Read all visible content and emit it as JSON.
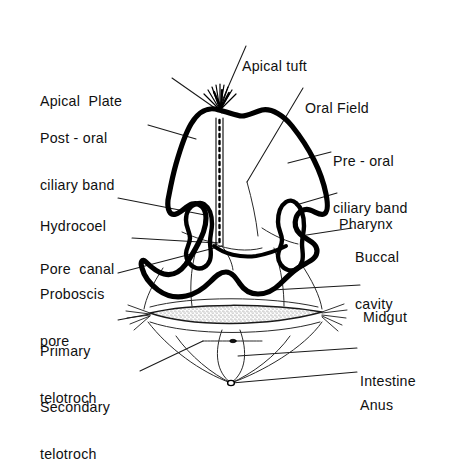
{
  "figure": {
    "type": "anatomical-diagram",
    "view": "ventral schematic",
    "background_color": "#ffffff",
    "ink_color": "#000000",
    "stipple_color": "#d8d8d8"
  },
  "labels": [
    {
      "id": "apical-tuft",
      "text": "Apical tuft",
      "lines": [
        "Apical tuft"
      ],
      "align": "left",
      "x": 242,
      "y": 28
    },
    {
      "id": "apical-plate",
      "text": "Apical  Plate",
      "lines": [
        "Apical  Plate"
      ],
      "align": "left",
      "x": 40,
      "y": 63
    },
    {
      "id": "oral-field",
      "text": "Oral Field",
      "lines": [
        "Oral Field"
      ],
      "align": "left",
      "x": 305,
      "y": 70
    },
    {
      "id": "post-oral-ciliary-band",
      "text": "Post - oral ciliary band",
      "lines": [
        "Post - oral",
        "ciliary band"
      ],
      "align": "left",
      "x": 40,
      "y": 100
    },
    {
      "id": "pre-oral-ciliary-band",
      "text": "Pre - oral ciliary band",
      "lines": [
        "Pre - oral",
        "ciliary band"
      ],
      "align": "left",
      "x": 333,
      "y": 123
    },
    {
      "id": "hydrocoel",
      "text": "Hydrocoel",
      "lines": [
        "Hydrocoel"
      ],
      "align": "left",
      "x": 40,
      "y": 188
    },
    {
      "id": "pharynx",
      "text": "Pharynx",
      "lines": [
        "Pharynx"
      ],
      "align": "left",
      "x": 339,
      "y": 186
    },
    {
      "id": "buccal-cavity",
      "text": "Buccal cavity",
      "lines": [
        "Buccal",
        "cavity"
      ],
      "align": "left",
      "x": 355,
      "y": 219
    },
    {
      "id": "pore-canal",
      "text": "Pore  canal",
      "lines": [
        "Pore  canal"
      ],
      "align": "left",
      "x": 40,
      "y": 231
    },
    {
      "id": "proboscis-pore",
      "text": "Proboscis pore",
      "lines": [
        "Proboscis",
        "pore"
      ],
      "align": "left",
      "x": 40,
      "y": 256
    },
    {
      "id": "midgut",
      "text": "Midgut",
      "lines": [
        "Midgut"
      ],
      "align": "left",
      "x": 363,
      "y": 279
    },
    {
      "id": "primary-telotroch",
      "text": "Primary telotroch",
      "lines": [
        "Primary",
        "telotroch"
      ],
      "align": "left",
      "x": 40,
      "y": 313
    },
    {
      "id": "intestine",
      "text": "Intestine",
      "lines": [
        "Intestine"
      ],
      "align": "left",
      "x": 360,
      "y": 343
    },
    {
      "id": "anus",
      "text": "Anus",
      "lines": [
        "Anus"
      ],
      "align": "left",
      "x": 360,
      "y": 367
    },
    {
      "id": "secondary-telotroch",
      "text": "Secondary telotroch",
      "lines": [
        "Secondary",
        "telotroch"
      ],
      "align": "left",
      "x": 40,
      "y": 369
    }
  ],
  "leaders": [
    {
      "id": "leader-apical-tuft",
      "from": [
        246,
        46
      ],
      "to": [
        219,
        108
      ]
    },
    {
      "id": "leader-apical-plate",
      "from": [
        172,
        78
      ],
      "to": [
        222,
        113
      ]
    },
    {
      "id": "leader-oral-field",
      "from": [
        303,
        88
      ],
      "to": [
        247,
        182
      ]
    },
    {
      "id": "leader-post-oral",
      "from": [
        148,
        125
      ],
      "to": [
        196,
        139
      ]
    },
    {
      "id": "leader-pre-oral",
      "from": [
        331,
        152
      ],
      "to": [
        288,
        163
      ]
    },
    {
      "id": "leader-hydrocoel",
      "from": [
        118,
        198
      ],
      "to": [
        205,
        215
      ]
    },
    {
      "id": "leader-pharynx",
      "from": [
        337,
        193
      ],
      "to": [
        296,
        205
      ]
    },
    {
      "id": "leader-buccal",
      "from": [
        352,
        228
      ],
      "to": [
        300,
        236
      ]
    },
    {
      "id": "leader-pore-canal",
      "from": [
        132,
        238
      ],
      "to": [
        217,
        243
      ]
    },
    {
      "id": "leader-proboscis-pore",
      "from": [
        118,
        273
      ],
      "to": [
        222,
        246
      ]
    },
    {
      "id": "leader-midgut",
      "from": [
        360,
        285
      ],
      "to": [
        272,
        290
      ]
    },
    {
      "id": "leader-primary-telotroch",
      "from": [
        118,
        320
      ],
      "to": [
        150,
        314
      ]
    },
    {
      "id": "leader-intestine",
      "from": [
        357,
        348
      ],
      "to": [
        238,
        356
      ]
    },
    {
      "id": "leader-anus",
      "from": [
        357,
        372
      ],
      "to": [
        232,
        383
      ]
    },
    {
      "id": "leader-secondary-telotroch",
      "from": [
        140,
        371
      ],
      "to": [
        203,
        341
      ]
    }
  ],
  "structures": [
    {
      "id": "body-outline",
      "kind": "thick-contour",
      "desc": "wavy bilobed larval body wall"
    },
    {
      "id": "apical-tuft-cilia",
      "kind": "cilia-fan",
      "desc": "fan of long cilia at apex"
    },
    {
      "id": "pore-canal-channel",
      "kind": "dashed-channel",
      "desc": "narrow vertical ladder canal below apical plate"
    },
    {
      "id": "hydrocoel-left",
      "kind": "lobed-sac",
      "desc": "left lobed coelomic sac"
    },
    {
      "id": "hydrocoel-right",
      "kind": "lobed-sac",
      "desc": "right lobed coelomic sac"
    },
    {
      "id": "primary-telotroch-band",
      "kind": "stippled-band",
      "desc": "horizontal lens-shaped stippled ciliary band with tufts at both ends"
    },
    {
      "id": "secondary-telotroch-arc",
      "kind": "thin-arc",
      "desc": "lower arc band"
    },
    {
      "id": "intestine-loop",
      "kind": "thin-loop",
      "desc": "U-shaped gut loop"
    },
    {
      "id": "anus-marker",
      "kind": "small-ring",
      "desc": "small opening at posterior tip"
    }
  ]
}
